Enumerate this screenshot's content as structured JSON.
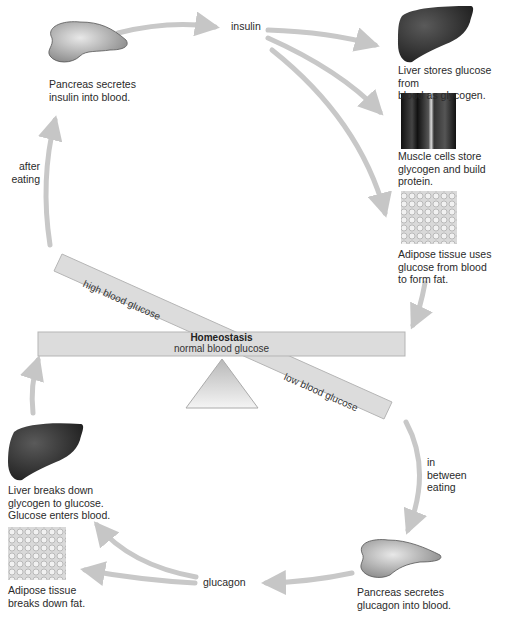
{
  "diagram": {
    "center": {
      "title": "Homeostasis",
      "subtitle": "normal blood glucose",
      "high_label": "high blood glucose",
      "low_label": "low blood glucose"
    },
    "high_path": {
      "trigger": "after\neating",
      "hormone": "insulin",
      "source": "Pancreas secretes\ninsulin into blood.",
      "targets": [
        {
          "icon": "liver-icon",
          "text": "Liver stores glucose from\nblood as glycogen."
        },
        {
          "icon": "muscle-icon",
          "text": "Muscle cells store\nglycogen and build\nprotein."
        },
        {
          "icon": "adipose-icon",
          "text": "Adipose tissue uses\nglucose from blood\nto form fat."
        }
      ]
    },
    "low_path": {
      "trigger": "in\nbetween\neating",
      "hormone": "glucagon",
      "source": "Pancreas secretes\nglucagon into blood.",
      "targets": [
        {
          "icon": "liver-icon",
          "text": "Liver breaks down\nglycogen to glucose.\nGlucose enters blood."
        },
        {
          "icon": "adipose-icon",
          "text": "Adipose tissue\nbreaks down fat."
        }
      ]
    },
    "colors": {
      "arrow": "#c8c8c8",
      "bar": "#dcdcdc",
      "bar_border": "#b5b5b5",
      "organ_dark": "#2b2b2b"
    }
  }
}
